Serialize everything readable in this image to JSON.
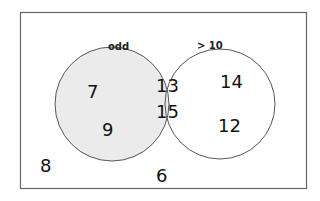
{
  "diagram": {
    "type": "venn",
    "colors": {
      "shaded": "#ebebeb",
      "stroke": "#555555",
      "frame": "#666666"
    },
    "sets": [
      {
        "label": "odd",
        "shaded": true
      },
      {
        "label": "> 10",
        "shaded": false
      }
    ],
    "regions": {
      "odd_only": [
        "7",
        "9"
      ],
      "intersection": [
        "13",
        "15"
      ],
      "gt10_only": [
        "14",
        "12"
      ],
      "outside": [
        "8",
        "6"
      ]
    }
  }
}
